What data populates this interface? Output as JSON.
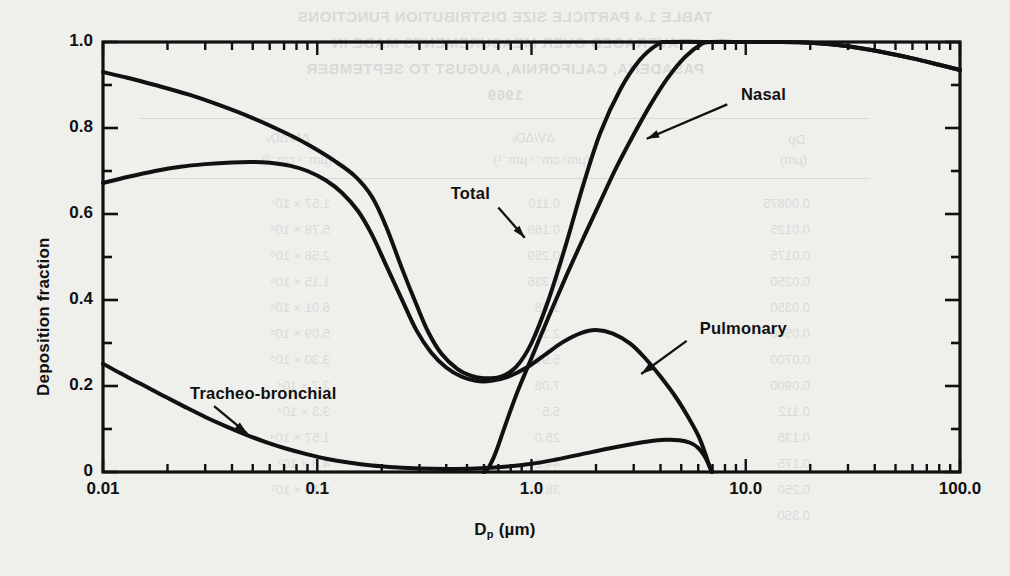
{
  "figure": {
    "background_color": "#efefec",
    "ink_color": "#111111"
  },
  "bleedthrough": {
    "note": "faint mirrored text showing through from the reverse side of the printed page",
    "title_lines": [
      "TABLE 1.4  PARTICLE SIZE DISTRIBUTION FUNCTIONS",
      "AVERAGED OVER MEASUREMENTS MADE IN",
      "PASADENA, CALIFORNIA, AUGUST TO SEPTEMBER",
      "1969"
    ],
    "headers": [
      "Dp",
      "(µm)",
      "ΔV/ΔDₚ",
      "(µm³ cm⁻³ µm⁻¹)",
      "ΔN/ΔDₚ",
      "(µm⁻³ cm⁻³)"
    ],
    "col_dp": [
      "0.00875",
      "0.0125",
      "0.0175",
      "0.0250",
      "0.0350",
      "0.0500",
      "0.0700",
      "0.0900",
      "0.112",
      "0.135",
      "0.175",
      "0.250",
      "0.350"
    ],
    "col_dv": [
      "0.110",
      "0.168",
      "0.259",
      "0.336",
      "1.08",
      "2.14",
      "5.99",
      "7.08",
      "5.5",
      "25.0",
      "44.2",
      "38.6"
    ],
    "col_dn": [
      "1.57 × 10⁷",
      "5.78 × 10⁶",
      "2.58 × 10⁶",
      "1.15 × 10⁶",
      "6.01 × 10⁵",
      "5.09 × 10⁵",
      "3.30 × 10⁵",
      "2.7 × 10⁴",
      "3.3 × 10⁴",
      "1.57 × 10⁴",
      "4.8 × 10³",
      "2.15 × 10³"
    ]
  },
  "chart_data": {
    "type": "line",
    "title": "",
    "xlabel": "Dₚ (µm)",
    "xlabel_main": "D",
    "xlabel_sub": "p",
    "xlabel_unit": " (µm)",
    "ylabel": "Deposition fraction",
    "xscale": "log",
    "yscale": "linear",
    "xlim": [
      0.01,
      100.0
    ],
    "ylim": [
      0.0,
      1.0
    ],
    "grid": false,
    "legend_position": "inline-annotations",
    "xticks": [
      {
        "value": 0.01,
        "label": "0.01"
      },
      {
        "value": 0.1,
        "label": "0.1"
      },
      {
        "value": 1.0,
        "label": "1.0"
      },
      {
        "value": 10.0,
        "label": "10.0"
      },
      {
        "value": 100.0,
        "label": "100.0"
      }
    ],
    "yticks": [
      {
        "value": 0.0,
        "label": "0"
      },
      {
        "value": 0.2,
        "label": "0.2"
      },
      {
        "value": 0.4,
        "label": "0.4"
      },
      {
        "value": 0.6,
        "label": "0.6"
      },
      {
        "value": 0.8,
        "label": "0.8"
      },
      {
        "value": 1.0,
        "label": "1.0"
      }
    ],
    "yminor_step": 0.1,
    "series": [
      {
        "name": "Total",
        "label": "Total",
        "label_x": 0.42,
        "label_y": 0.645,
        "arrow_from_x": 0.7,
        "arrow_from_y": 0.615,
        "arrow_to_x": 0.93,
        "arrow_to_y": 0.545,
        "points": [
          [
            0.01,
            0.93
          ],
          [
            0.013,
            0.917
          ],
          [
            0.0175,
            0.9
          ],
          [
            0.025,
            0.878
          ],
          [
            0.035,
            0.853
          ],
          [
            0.05,
            0.823
          ],
          [
            0.07,
            0.79
          ],
          [
            0.09,
            0.762
          ],
          [
            0.12,
            0.724
          ],
          [
            0.15,
            0.688
          ],
          [
            0.18,
            0.64
          ],
          [
            0.21,
            0.57
          ],
          [
            0.25,
            0.47
          ],
          [
            0.29,
            0.39
          ],
          [
            0.33,
            0.325
          ],
          [
            0.38,
            0.275
          ],
          [
            0.45,
            0.24
          ],
          [
            0.52,
            0.224
          ],
          [
            0.6,
            0.218
          ],
          [
            0.72,
            0.222
          ],
          [
            0.85,
            0.245
          ],
          [
            1.0,
            0.3
          ],
          [
            1.2,
            0.4
          ],
          [
            1.45,
            0.53
          ],
          [
            1.75,
            0.67
          ],
          [
            2.1,
            0.79
          ],
          [
            2.6,
            0.89
          ],
          [
            3.2,
            0.958
          ],
          [
            3.9,
            0.995
          ],
          [
            4.4,
            1.0
          ],
          [
            8.0,
            1.0
          ],
          [
            14.0,
            1.0
          ],
          [
            20.0,
            0.998
          ],
          [
            30.0,
            0.99
          ],
          [
            45.0,
            0.975
          ],
          [
            60.0,
            0.962
          ],
          [
            80.0,
            0.947
          ],
          [
            100.0,
            0.935
          ]
        ]
      },
      {
        "name": "Nasal",
        "label": "Nasal",
        "label_x": 9.5,
        "label_y": 0.875,
        "arrow_from_x": 8.2,
        "arrow_from_y": 0.855,
        "arrow_to_x": 3.45,
        "arrow_to_y": 0.775,
        "points": [
          [
            0.6,
            0.0
          ],
          [
            0.63,
            0.01
          ],
          [
            0.68,
            0.045
          ],
          [
            0.75,
            0.105
          ],
          [
            0.85,
            0.18
          ],
          [
            1.0,
            0.265
          ],
          [
            1.2,
            0.36
          ],
          [
            1.45,
            0.455
          ],
          [
            1.75,
            0.545
          ],
          [
            2.1,
            0.63
          ],
          [
            2.5,
            0.71
          ],
          [
            3.0,
            0.785
          ],
          [
            3.6,
            0.855
          ],
          [
            4.3,
            0.915
          ],
          [
            5.2,
            0.965
          ],
          [
            6.2,
            0.995
          ],
          [
            6.9,
            1.0
          ],
          [
            10.0,
            1.0
          ],
          [
            14.0,
            1.0
          ],
          [
            20.0,
            0.998
          ],
          [
            30.0,
            0.99
          ],
          [
            45.0,
            0.975
          ],
          [
            60.0,
            0.962
          ],
          [
            80.0,
            0.947
          ],
          [
            100.0,
            0.935
          ]
        ]
      },
      {
        "name": "Pulmonary",
        "label": "Pulmonary",
        "label_x": 6.1,
        "label_y": 0.33,
        "arrow_from_x": 5.3,
        "arrow_from_y": 0.305,
        "arrow_to_x": 3.25,
        "arrow_to_y": 0.228,
        "points": [
          [
            0.01,
            0.672
          ],
          [
            0.013,
            0.686
          ],
          [
            0.0175,
            0.7
          ],
          [
            0.023,
            0.71
          ],
          [
            0.03,
            0.716
          ],
          [
            0.04,
            0.72
          ],
          [
            0.05,
            0.721
          ],
          [
            0.06,
            0.719
          ],
          [
            0.075,
            0.712
          ],
          [
            0.09,
            0.7
          ],
          [
            0.11,
            0.678
          ],
          [
            0.13,
            0.65
          ],
          [
            0.155,
            0.607
          ],
          [
            0.18,
            0.552
          ],
          [
            0.21,
            0.48
          ],
          [
            0.25,
            0.398
          ],
          [
            0.29,
            0.33
          ],
          [
            0.34,
            0.278
          ],
          [
            0.4,
            0.243
          ],
          [
            0.47,
            0.222
          ],
          [
            0.55,
            0.212
          ],
          [
            0.65,
            0.212
          ],
          [
            0.78,
            0.222
          ],
          [
            0.95,
            0.243
          ],
          [
            1.15,
            0.272
          ],
          [
            1.4,
            0.302
          ],
          [
            1.7,
            0.323
          ],
          [
            2.0,
            0.33
          ],
          [
            2.4,
            0.322
          ],
          [
            2.9,
            0.298
          ],
          [
            3.4,
            0.264
          ],
          [
            4.0,
            0.222
          ],
          [
            4.7,
            0.175
          ],
          [
            5.4,
            0.127
          ],
          [
            6.0,
            0.085
          ],
          [
            6.45,
            0.045
          ],
          [
            6.75,
            0.015
          ],
          [
            6.95,
            0.0
          ]
        ]
      },
      {
        "name": "Tracheo-bronchial",
        "label": "Tracheo-bronchial",
        "label_x": 0.0255,
        "label_y": 0.178,
        "arrow_from_x": 0.033,
        "arrow_from_y": 0.153,
        "arrow_to_x": 0.047,
        "arrow_to_y": 0.09,
        "points": [
          [
            0.01,
            0.252
          ],
          [
            0.012,
            0.23
          ],
          [
            0.015,
            0.205
          ],
          [
            0.019,
            0.178
          ],
          [
            0.024,
            0.152
          ],
          [
            0.03,
            0.128
          ],
          [
            0.038,
            0.105
          ],
          [
            0.047,
            0.086
          ],
          [
            0.058,
            0.069
          ],
          [
            0.072,
            0.054
          ],
          [
            0.09,
            0.041
          ],
          [
            0.11,
            0.031
          ],
          [
            0.14,
            0.022
          ],
          [
            0.18,
            0.015
          ],
          [
            0.23,
            0.011
          ],
          [
            0.3,
            0.008
          ],
          [
            0.4,
            0.007
          ],
          [
            0.55,
            0.008
          ],
          [
            0.75,
            0.012
          ],
          [
            1.0,
            0.019
          ],
          [
            1.3,
            0.029
          ],
          [
            1.7,
            0.041
          ],
          [
            2.2,
            0.053
          ],
          [
            2.8,
            0.063
          ],
          [
            3.5,
            0.071
          ],
          [
            4.2,
            0.075
          ],
          [
            4.9,
            0.074
          ],
          [
            5.5,
            0.068
          ],
          [
            6.0,
            0.056
          ],
          [
            6.4,
            0.038
          ],
          [
            6.7,
            0.019
          ],
          [
            6.95,
            0.0
          ]
        ]
      }
    ]
  }
}
